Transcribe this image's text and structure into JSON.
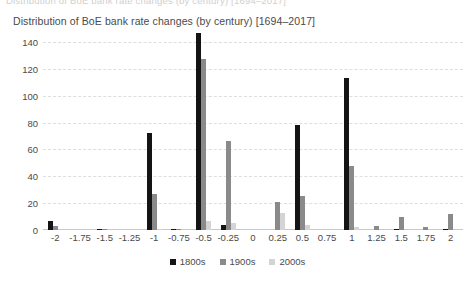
{
  "top_clip_text": "Distribution of BoE bank rate changes (by century) [1694–2017]",
  "chart_data": {
    "type": "bar",
    "title": "Distribution of BoE bank rate changes (by century) [1694–2017]",
    "xlabel": "",
    "ylabel": "",
    "ylim": [
      0,
      140
    ],
    "yticks": [
      0,
      20,
      40,
      60,
      80,
      100,
      120,
      140
    ],
    "ytick_labels": [
      "0",
      "20",
      "40",
      "60",
      "80",
      "100",
      "120",
      "140"
    ],
    "grid": true,
    "legend_position": "bottom-center",
    "categories": [
      "-2",
      "-1.75",
      "-1.5",
      "-1.25",
      "-1",
      "-0.75",
      "-0.5",
      "-0.25",
      "0",
      "0.25",
      "0.5",
      "0.75",
      "1",
      "1.25",
      "1.5",
      "1.75",
      "2"
    ],
    "series": [
      {
        "name": "1800s",
        "color": "#141414",
        "values": [
          7,
          0,
          1,
          0,
          72,
          1,
          147,
          4,
          0,
          0,
          78,
          0,
          113,
          0,
          1,
          0,
          1
        ]
      },
      {
        "name": "1900s",
        "color": "#8a8a8a",
        "values": [
          3,
          0,
          1,
          0,
          27,
          1,
          127,
          66,
          0,
          21,
          25,
          0,
          48,
          3,
          10,
          2,
          12
        ]
      },
      {
        "name": "2000s",
        "color": "#d4d4d4",
        "values": [
          0,
          0,
          0,
          0,
          1,
          0,
          7,
          5,
          0,
          13,
          4,
          0,
          2,
          0,
          0,
          0,
          0
        ]
      }
    ]
  },
  "legend": {
    "items": [
      {
        "label": "1800s",
        "color": "#141414"
      },
      {
        "label": "1900s",
        "color": "#8a8a8a"
      },
      {
        "label": "2000s",
        "color": "#d4d4d4"
      }
    ]
  }
}
